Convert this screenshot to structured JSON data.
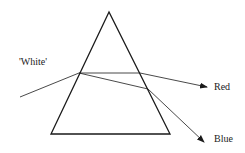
{
  "diagram": {
    "labels": {
      "incoming": "'White'",
      "red": "Red",
      "blue": "Blue"
    },
    "colors": {
      "stroke": "#1a1a1a",
      "text": "#222222",
      "background": "#ffffff"
    }
  }
}
